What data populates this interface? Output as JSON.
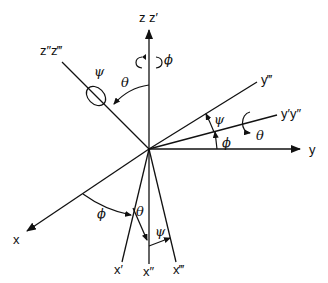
{
  "diagram": {
    "type": "euler-angles-rotation",
    "origin": [
      149,
      149
    ],
    "axes": {
      "z": {
        "label": "z z′"
      },
      "z3": {
        "label": "z″z‴"
      },
      "y": {
        "label": "y"
      },
      "y12": {
        "label": "y′y″"
      },
      "y3": {
        "label": "y‴"
      },
      "x": {
        "label": "x"
      },
      "x1": {
        "label": "x′"
      },
      "x2": {
        "label": "x″"
      },
      "x3": {
        "label": "x‴"
      }
    },
    "angles": {
      "phi_z": "ϕ",
      "theta_z": "θ",
      "psi_z": "ψ",
      "psi_y": "ψ",
      "phi_y": "ϕ",
      "theta_y": "θ",
      "phi_x": "ϕ",
      "theta_x": "θ",
      "psi_x": "ψ"
    },
    "colors": {
      "stroke": "#111111",
      "background": "#ffffff"
    }
  }
}
